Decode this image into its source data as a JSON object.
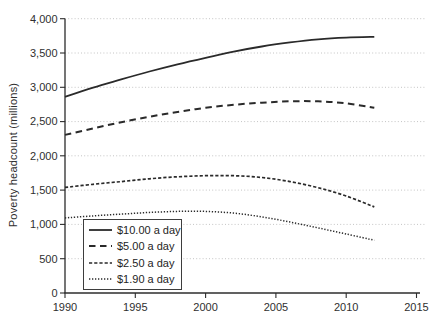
{
  "chart_data": {
    "type": "line",
    "title": "",
    "xlabel": "",
    "ylabel": "Poverty headcount (millions)",
    "xlim": [
      1990,
      2015
    ],
    "ylim": [
      0,
      4000
    ],
    "x_ticks": [
      1990,
      1995,
      2000,
      2005,
      2010,
      2015
    ],
    "y_ticks": [
      0,
      500,
      1000,
      1500,
      2000,
      2500,
      3000,
      3500,
      4000
    ],
    "y_tick_labels": [
      "0",
      "500",
      "1,000",
      "1,500",
      "2,000",
      "2,500",
      "3,000",
      "3,500",
      "4,000"
    ],
    "grid": "horizontal dotted gridlines at every 500",
    "legend_position": "lower left",
    "x": [
      1990,
      1992,
      1994,
      1996,
      1998,
      2000,
      2002,
      2004,
      2006,
      2008,
      2010,
      2012
    ],
    "series": [
      {
        "name": "$10.00 a day",
        "dash": "solid",
        "values": [
          2860,
          2995,
          3115,
          3230,
          3335,
          3430,
          3520,
          3595,
          3655,
          3700,
          3725,
          3735
        ]
      },
      {
        "name": "$5.00 a day",
        "dash": "long-dash",
        "values": [
          2305,
          2400,
          2490,
          2570,
          2640,
          2700,
          2745,
          2775,
          2795,
          2795,
          2765,
          2700
        ]
      },
      {
        "name": "$2.50 a day",
        "dash": "short-dash",
        "values": [
          1540,
          1585,
          1625,
          1665,
          1695,
          1710,
          1710,
          1685,
          1625,
          1535,
          1415,
          1255
        ]
      },
      {
        "name": "$1.90 a day",
        "dash": "dotted",
        "values": [
          1095,
          1125,
          1150,
          1175,
          1190,
          1190,
          1165,
          1110,
          1035,
          950,
          860,
          770
        ]
      }
    ],
    "colors": {
      "line": "#2a2a2a",
      "grid": "#c4c4c4",
      "text": "#2f2f2f",
      "background": "#ffffff"
    }
  }
}
